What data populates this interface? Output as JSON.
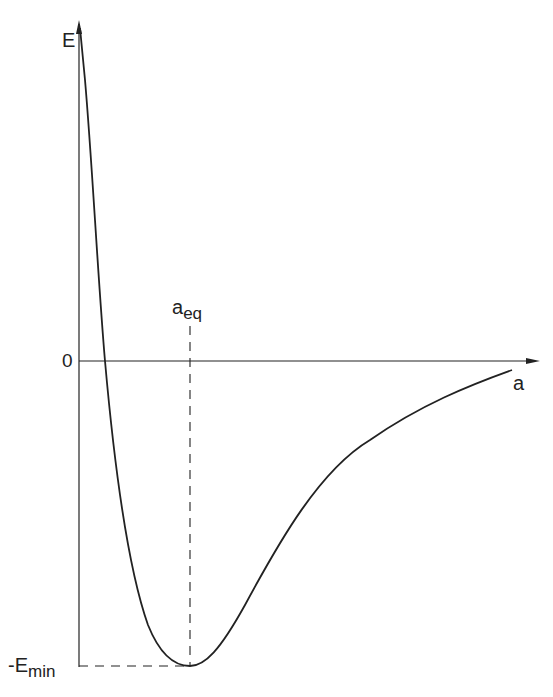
{
  "diagram": {
    "y_axis_label": "E",
    "x_axis_label": "a",
    "origin_label": "0",
    "equilibrium_label": {
      "main": "a",
      "sub": "eq"
    },
    "minimum_label": {
      "main": "-E",
      "sub": "min"
    },
    "line_color": "#222222"
  }
}
